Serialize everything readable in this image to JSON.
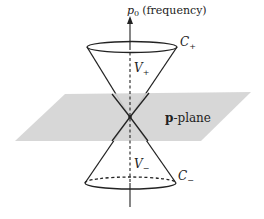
{
  "diagram": {
    "axis_label": {
      "symbol": "p",
      "subscript": "0",
      "text": "(frequency)"
    },
    "upper_cone": {
      "name": "C",
      "subscript": "+",
      "volume": "V",
      "volume_sub": "+"
    },
    "lower_cone": {
      "name": "C",
      "subscript": "−",
      "volume": "V",
      "volume_sub": "−"
    },
    "plane": {
      "bold": "p",
      "text": "-plane"
    },
    "colors": {
      "plane_fill": "#d4d4d4",
      "line": "#222222"
    }
  }
}
